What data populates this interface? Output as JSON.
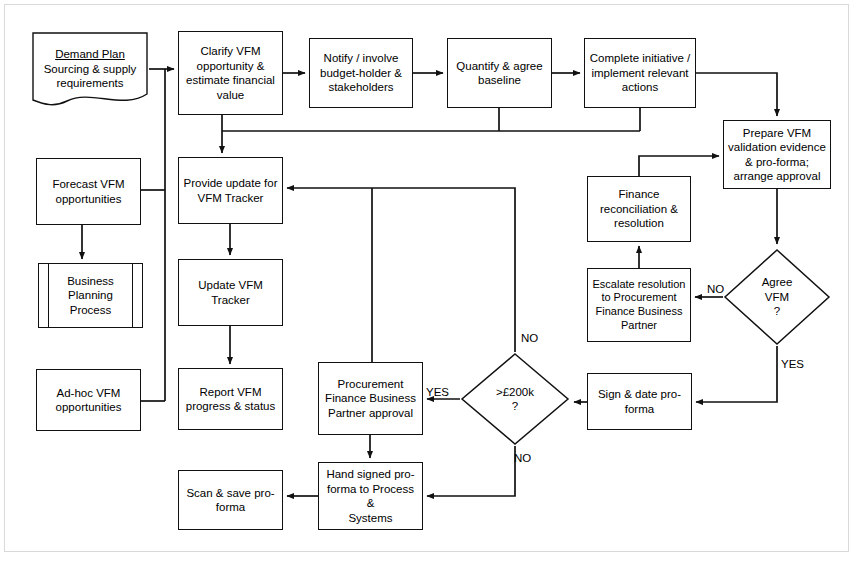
{
  "diagram": {
    "stroke_color": "#111111",
    "background_color": "#ffffff",
    "frame_color": "#d9d9d9"
  },
  "nodes": [
    {
      "id": "demand-plan",
      "shape": "document",
      "title": "Demand Plan",
      "label": "Sourcing & supply\nrequirements",
      "x": 31,
      "y": 31,
      "w": 118,
      "h": 76
    },
    {
      "id": "clarify-vfm",
      "shape": "process",
      "label": "Clarify VFM\nopportunity &\nestimate financial\nvalue",
      "x": 178,
      "y": 31,
      "w": 105,
      "h": 84
    },
    {
      "id": "notify-involve",
      "shape": "process",
      "label": "Notify / involve\nbudget-holder &\nstakeholders",
      "x": 309,
      "y": 38,
      "w": 104,
      "h": 70
    },
    {
      "id": "quantify-baseline",
      "shape": "process",
      "label": "Quantify & agree\nbaseline",
      "x": 447,
      "y": 38,
      "w": 105,
      "h": 70
    },
    {
      "id": "complete-initiative",
      "shape": "process",
      "label": "Complete initiative /\nimplement relevant\nactions",
      "x": 584,
      "y": 38,
      "w": 112,
      "h": 70
    },
    {
      "id": "prepare-vfm",
      "shape": "process",
      "label": "Prepare VFM\nvalidation evidence\n& pro-forma;\narrange approval",
      "x": 723,
      "y": 120,
      "w": 108,
      "h": 69
    },
    {
      "id": "forecast-vfm",
      "shape": "process",
      "label": "Forecast VFM\nopportunities",
      "x": 36,
      "y": 158,
      "w": 105,
      "h": 67
    },
    {
      "id": "provide-update",
      "shape": "process",
      "label": "Provide update for\nVFM Tracker",
      "x": 178,
      "y": 157,
      "w": 105,
      "h": 67
    },
    {
      "id": "finance-reconciliation",
      "shape": "process",
      "label": "Finance\nreconciliation &\nresolution",
      "x": 587,
      "y": 176,
      "w": 104,
      "h": 66
    },
    {
      "id": "business-planning",
      "shape": "predefined",
      "label": "Business\nPlanning\nProcess",
      "x": 38,
      "y": 263,
      "w": 105,
      "h": 65
    },
    {
      "id": "update-tracker",
      "shape": "process",
      "label": "Update VFM\nTracker",
      "x": 178,
      "y": 259,
      "w": 105,
      "h": 67
    },
    {
      "id": "escalate-resolution",
      "shape": "process",
      "label": "Escalate resolution\nto Procurement\nFinance Business\nPartner",
      "x": 587,
      "y": 268,
      "w": 104,
      "h": 74
    },
    {
      "id": "agree-vfm",
      "shape": "decision",
      "label": "Agree\nVFM\n?",
      "x": 723,
      "y": 248,
      "w": 108,
      "h": 98
    },
    {
      "id": "adhoc-vfm",
      "shape": "process",
      "label": "Ad-hoc VFM\nopportunities",
      "x": 36,
      "y": 369,
      "w": 105,
      "h": 62
    },
    {
      "id": "report-vfm",
      "shape": "process",
      "label": "Report VFM\nprogress & status",
      "x": 178,
      "y": 368,
      "w": 105,
      "h": 62
    },
    {
      "id": "pfbp-approval",
      "shape": "process",
      "label": "Procurement\nFinance Business\nPartner approval",
      "x": 318,
      "y": 362,
      "w": 105,
      "h": 73
    },
    {
      "id": "threshold-decision",
      "shape": "decision",
      "label": ">£200k\n?",
      "x": 460,
      "y": 352,
      "w": 110,
      "h": 94
    },
    {
      "id": "sign-date",
      "shape": "process",
      "label": "Sign & date pro-\nforma",
      "x": 587,
      "y": 373,
      "w": 105,
      "h": 57
    },
    {
      "id": "scan-save",
      "shape": "process",
      "label": "Scan & save pro-\nforma",
      "x": 178,
      "y": 470,
      "w": 105,
      "h": 60
    },
    {
      "id": "hand-signed",
      "shape": "process",
      "label": "Hand signed pro-\nforma to Process &\nSystems",
      "x": 318,
      "y": 462,
      "w": 105,
      "h": 68
    }
  ],
  "edge_labels": [
    {
      "id": "agree-vfm-no",
      "text": "NO",
      "x": 707,
      "y": 283
    },
    {
      "id": "agree-vfm-yes",
      "text": "YES",
      "x": 781,
      "y": 358
    },
    {
      "id": "threshold-no-top",
      "text": "NO",
      "x": 521,
      "y": 332
    },
    {
      "id": "threshold-yes",
      "text": "YES",
      "x": 426,
      "y": 386
    },
    {
      "id": "threshold-no-bottom",
      "text": "NO",
      "x": 514,
      "y": 452
    }
  ],
  "connectors": [
    {
      "id": "demand-to-clarify",
      "from": "demand-plan",
      "to": "clarify-vfm"
    },
    {
      "id": "clarify-to-notify",
      "from": "clarify-vfm",
      "to": "notify-involve"
    },
    {
      "id": "notify-to-quantify",
      "from": "notify-involve",
      "to": "quantify-baseline"
    },
    {
      "id": "quantify-to-complete",
      "from": "quantify-baseline",
      "to": "complete-initiative"
    },
    {
      "id": "complete-to-prepare",
      "from": "complete-initiative",
      "to": "prepare-vfm"
    },
    {
      "id": "topbus-to-provide-update",
      "from": "top-bus",
      "to": "provide-update"
    },
    {
      "id": "demand-branch-to-bus",
      "from": "demand-plan",
      "to": "left-bus"
    },
    {
      "id": "forecast-to-left-bus",
      "from": "forecast-vfm",
      "to": "left-bus"
    },
    {
      "id": "forecast-to-business-planning",
      "from": "forecast-vfm",
      "to": "business-planning"
    },
    {
      "id": "adhoc-to-left-bus",
      "from": "adhoc-vfm",
      "to": "left-bus"
    },
    {
      "id": "provide-to-update-tracker",
      "from": "provide-update",
      "to": "update-tracker"
    },
    {
      "id": "update-to-report",
      "from": "update-tracker",
      "to": "report-vfm"
    },
    {
      "id": "prepare-to-agree",
      "from": "prepare-vfm",
      "to": "agree-vfm"
    },
    {
      "id": "agree-no-to-escalate",
      "from": "agree-vfm",
      "to": "escalate-resolution"
    },
    {
      "id": "escalate-to-finance",
      "from": "escalate-resolution",
      "to": "finance-reconciliation"
    },
    {
      "id": "finance-to-prepare",
      "from": "finance-reconciliation",
      "to": "prepare-vfm"
    },
    {
      "id": "agree-yes-to-sign",
      "from": "agree-vfm",
      "to": "sign-date"
    },
    {
      "id": "sign-to-threshold",
      "from": "sign-date",
      "to": "threshold-decision"
    },
    {
      "id": "threshold-yes-to-pfbp",
      "from": "threshold-decision",
      "to": "pfbp-approval"
    },
    {
      "id": "threshold-no-to-provide",
      "from": "threshold-decision",
      "to": "provide-update"
    },
    {
      "id": "threshold-no-to-hand",
      "from": "threshold-decision",
      "to": "hand-signed"
    },
    {
      "id": "pfbp-to-hand-signed",
      "from": "pfbp-approval",
      "to": "hand-signed"
    },
    {
      "id": "hand-to-scan",
      "from": "hand-signed",
      "to": "scan-save"
    }
  ]
}
